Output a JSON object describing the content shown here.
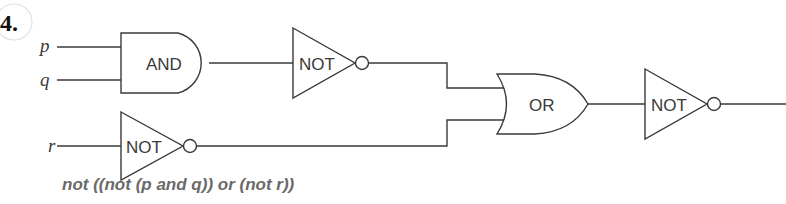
{
  "problem": {
    "number": "4."
  },
  "inputs": {
    "p": "p",
    "q": "q",
    "r": "r"
  },
  "gates": {
    "and1": "AND",
    "not1": "NOT",
    "not_r": "NOT",
    "or1": "OR",
    "not_out": "NOT"
  },
  "expression": "not ((not (p and q)) or (not r))",
  "colors": {
    "line": "#3a3a3a",
    "expression_text": "#6a6a6a"
  }
}
